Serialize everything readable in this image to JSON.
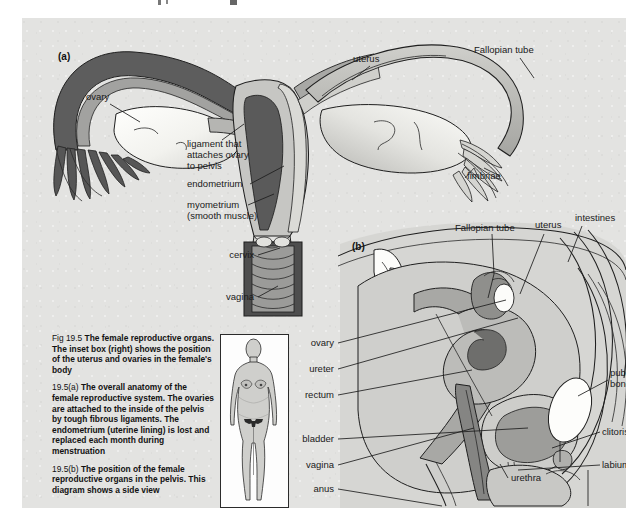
{
  "figure": {
    "title": "Fig 19.5 The female reproductive organs",
    "background_color": "#e3e3e1",
    "panel_a_id": "(a)",
    "panel_b_id": "(b)"
  },
  "panel_a": {
    "id": "(a)",
    "description": "Frontal view of the female reproductive system",
    "labels": [
      {
        "name": "ovary",
        "text": "ovary",
        "x": 64,
        "y": 82,
        "anchor": "start"
      },
      {
        "name": "ligament-line1",
        "text": "ligament that",
        "x": 165,
        "y": 129,
        "anchor": "start"
      },
      {
        "name": "ligament-line2",
        "text": "attaches ovary",
        "x": 165,
        "y": 140,
        "anchor": "start"
      },
      {
        "name": "ligament-line3",
        "text": "to pelvis",
        "x": 165,
        "y": 151,
        "anchor": "start"
      },
      {
        "name": "endometrium",
        "text": "endometrium",
        "x": 165,
        "y": 169,
        "anchor": "start"
      },
      {
        "name": "myometrium-line1",
        "text": "myometrium",
        "x": 165,
        "y": 190,
        "anchor": "start"
      },
      {
        "name": "myometrium-line2",
        "text": "(smooth muscle)",
        "x": 165,
        "y": 201,
        "anchor": "start"
      },
      {
        "name": "cervix",
        "text": "cervix",
        "x": 232,
        "y": 240,
        "anchor": "end"
      },
      {
        "name": "vagina",
        "text": "vagina",
        "x": 232,
        "y": 282,
        "anchor": "end"
      },
      {
        "name": "uterus",
        "text": "uterus",
        "x": 331,
        "y": 44,
        "anchor": "start"
      },
      {
        "name": "fallopian-tube",
        "text": "Fallopian tube",
        "x": 452,
        "y": 35,
        "anchor": "start"
      },
      {
        "name": "fimbriae",
        "text": "fimbriae",
        "x": 445,
        "y": 161,
        "anchor": "start"
      }
    ]
  },
  "panel_b": {
    "id": "(b)",
    "description": "Sagittal side view of the female reproductive organs in the pelvis",
    "labels": [
      {
        "name": "fallopian-tube",
        "text": "Fallopian tube",
        "x": 433,
        "y": 213,
        "anchor": "start"
      },
      {
        "name": "uterus",
        "text": "uterus",
        "x": 513,
        "y": 210,
        "anchor": "start"
      },
      {
        "name": "intestines",
        "text": "intestines",
        "x": 553,
        "y": 203,
        "anchor": "start"
      },
      {
        "name": "ovary",
        "text": "ovary",
        "x": 312,
        "y": 328,
        "anchor": "end"
      },
      {
        "name": "ureter",
        "text": "ureter",
        "x": 312,
        "y": 354,
        "anchor": "end"
      },
      {
        "name": "rectum",
        "text": "rectum",
        "x": 312,
        "y": 380,
        "anchor": "end"
      },
      {
        "name": "bladder",
        "text": "bladder",
        "x": 312,
        "y": 424,
        "anchor": "end"
      },
      {
        "name": "vagina",
        "text": "vagina",
        "x": 312,
        "y": 450,
        "anchor": "end"
      },
      {
        "name": "anus",
        "text": "anus",
        "x": 312,
        "y": 474,
        "anchor": "end"
      },
      {
        "name": "pubic-bone-1",
        "text": "pubic",
        "x": 588,
        "y": 358,
        "anchor": "start"
      },
      {
        "name": "pubic-bone-2",
        "text": "bone",
        "x": 588,
        "y": 369,
        "anchor": "start"
      },
      {
        "name": "clitoris",
        "text": "clitoris",
        "x": 580,
        "y": 417,
        "anchor": "start"
      },
      {
        "name": "labium",
        "text": "labium",
        "x": 580,
        "y": 450,
        "anchor": "start"
      },
      {
        "name": "urethra",
        "text": "urethra",
        "x": 489,
        "y": 463,
        "anchor": "start"
      }
    ]
  },
  "caption": {
    "main_tag": "Fig 19.5",
    "main_text": "The female reproductive organs. The inset box (right) shows the position of the uterus and ovaries in the female's body",
    "a_tag": "19.5(a)",
    "a_text": "The overall anatomy of the female reproductive system. The ovaries are attached to the inside of the pelvis by tough fibrous ligaments. The endometrium (uterine lining) is lost and replaced each month during menstruation",
    "b_tag": "19.5(b)",
    "b_text": "The position of the female reproductive organs in the pelvis. This diagram shows a side view"
  },
  "inset": {
    "name": "female-body-inset",
    "description": "Silhouette of a female body with the uterus and ovaries marked in dark"
  },
  "colors": {
    "background": "#e3e3e1",
    "outline": "#1f1f1f",
    "dark_tissue": "#5e5e5e",
    "mid_tissue": "#9a9a9a",
    "light_tissue": "#c3c3c3",
    "pale_tissue": "#d8d8d6",
    "white_tissue": "#fbfbf8",
    "text": "#121212"
  }
}
